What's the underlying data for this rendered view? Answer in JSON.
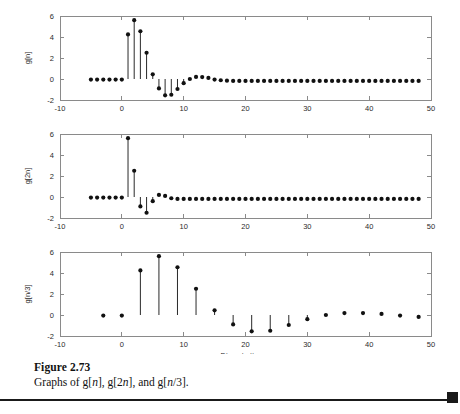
{
  "figure": {
    "caption_label": "Figure 2.73",
    "caption_text_prefix": "Graphs of g[",
    "caption_full": "Graphs of g[n], g[2n], and g[n/3].",
    "page_rule_marker": "black-square"
  },
  "axes": {
    "xlabel": "Discrete time n",
    "xlabel_plain": "Discrete time",
    "xlabel_var": "n",
    "xticks": [
      -10,
      0,
      10,
      20,
      30,
      40,
      50
    ],
    "xticklabels": [
      "-10",
      "0",
      "10",
      "20",
      "30",
      "40",
      "50"
    ],
    "yticks": [
      -2,
      0,
      2,
      4,
      6
    ],
    "yticklabels": [
      "-2",
      "0",
      "2",
      "4",
      "6"
    ],
    "xlim": [
      -10,
      50
    ],
    "ylim": [
      -2,
      6
    ]
  },
  "chart_data": [
    {
      "type": "scatter",
      "plot_id": "g-n",
      "title": "",
      "ylabel": "g[n]",
      "xlabel": "",
      "xlim": [
        -10,
        50
      ],
      "ylim": [
        -2,
        6
      ],
      "xticks": [
        -10,
        0,
        10,
        20,
        30,
        40,
        50
      ],
      "yticks": [
        -2,
        0,
        2,
        4,
        6
      ],
      "grid": false,
      "legend": "none",
      "x": [
        -5,
        -4,
        -3,
        -2,
        -1,
        0,
        1,
        2,
        3,
        4,
        5,
        6,
        7,
        8,
        9,
        10,
        11,
        12,
        13,
        14,
        15,
        16,
        17,
        18,
        19,
        20,
        21,
        22,
        23,
        24,
        25,
        26,
        27,
        28,
        29,
        30,
        31,
        32,
        33,
        34,
        35,
        36,
        37,
        38,
        39,
        40,
        41,
        42,
        43,
        44,
        45,
        46,
        47,
        48
      ],
      "values": [
        -0.05,
        -0.05,
        -0.05,
        -0.05,
        -0.05,
        -0.05,
        4.25,
        5.6,
        4.55,
        2.5,
        0.45,
        -0.9,
        -1.55,
        -1.5,
        -0.95,
        -0.4,
        0.0,
        0.2,
        0.18,
        0.1,
        -0.05,
        -0.12,
        -0.16,
        -0.18,
        -0.18,
        -0.18,
        -0.18,
        -0.18,
        -0.18,
        -0.18,
        -0.18,
        -0.18,
        -0.18,
        -0.18,
        -0.18,
        -0.18,
        -0.18,
        -0.18,
        -0.18,
        -0.18,
        -0.18,
        -0.18,
        -0.18,
        -0.18,
        -0.18,
        -0.18,
        -0.18,
        -0.18,
        -0.18,
        -0.18,
        -0.18,
        -0.18,
        -0.18,
        -0.18
      ]
    },
    {
      "type": "scatter",
      "plot_id": "g-2n",
      "title": "",
      "ylabel": "g[2n]",
      "xlabel": "",
      "xlim": [
        -10,
        50
      ],
      "ylim": [
        -2,
        6
      ],
      "xticks": [
        -10,
        0,
        10,
        20,
        30,
        40,
        50
      ],
      "yticks": [
        -2,
        0,
        2,
        4,
        6
      ],
      "grid": false,
      "legend": "none",
      "x": [
        -5,
        -4,
        -3,
        -2,
        -1,
        0,
        1,
        2,
        3,
        4,
        5,
        6,
        7,
        8,
        9,
        10,
        11,
        12,
        13,
        14,
        15,
        16,
        17,
        18,
        19,
        20,
        21,
        22,
        23,
        24,
        25,
        26,
        27,
        28,
        29,
        30,
        31,
        32,
        33,
        34,
        35,
        36,
        37,
        38,
        39,
        40,
        41,
        42,
        43,
        44,
        45,
        46,
        47,
        48
      ],
      "values": [
        -0.05,
        -0.05,
        -0.05,
        -0.05,
        -0.05,
        -0.05,
        5.6,
        2.5,
        -0.9,
        -1.5,
        -0.4,
        0.2,
        0.1,
        -0.12,
        -0.18,
        -0.18,
        -0.18,
        -0.18,
        -0.18,
        -0.18,
        -0.18,
        -0.18,
        -0.18,
        -0.18,
        -0.18,
        -0.18,
        -0.18,
        -0.18,
        -0.18,
        -0.18,
        -0.18,
        -0.18,
        -0.18,
        -0.18,
        -0.18,
        -0.18,
        -0.18,
        -0.18,
        -0.18,
        -0.18,
        -0.18,
        -0.18,
        -0.18,
        -0.18,
        -0.18,
        -0.18,
        -0.18,
        -0.18,
        -0.18,
        -0.18,
        -0.18,
        -0.18,
        -0.18,
        -0.18
      ]
    },
    {
      "type": "scatter",
      "plot_id": "g-n-over-3",
      "title": "",
      "ylabel": "g[n/3]",
      "xlabel": "Discrete time n",
      "xlim": [
        -10,
        50
      ],
      "ylim": [
        -2,
        6
      ],
      "xticks": [
        -10,
        0,
        10,
        20,
        30,
        40,
        50
      ],
      "yticks": [
        -2,
        0,
        2,
        4,
        6
      ],
      "grid": false,
      "legend": "none",
      "x": [
        -3,
        0,
        3,
        6,
        9,
        12,
        15,
        18,
        21,
        24,
        27,
        30,
        33,
        36,
        39,
        42,
        45,
        48
      ],
      "values": [
        -0.05,
        -0.05,
        4.25,
        5.6,
        4.55,
        2.5,
        0.45,
        -0.9,
        -1.55,
        -1.5,
        -0.95,
        -0.4,
        0.0,
        0.18,
        0.18,
        0.1,
        -0.05,
        -0.18
      ]
    }
  ]
}
